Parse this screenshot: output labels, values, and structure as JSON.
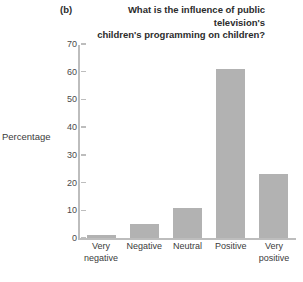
{
  "figure": {
    "panel_letter": "(b)",
    "title_line_1": "What is the influence of public television's",
    "title_line_2": "children's programming on children?",
    "bar_color": "#b2b2b2",
    "axis_color": "#bdbdbd",
    "text_color": "#3b3b3b"
  },
  "chart_data": {
    "type": "bar",
    "title": "What is the influence of public television's children's programming on children?",
    "xlabel": "",
    "ylabel": "Percentage",
    "categories": [
      "Very negative",
      "Negative",
      "Neutral",
      "Positive",
      "Very positive"
    ],
    "category_lines": [
      [
        "Very",
        "negative"
      ],
      [
        "Negative",
        ""
      ],
      [
        "Neutral",
        ""
      ],
      [
        "Positive",
        ""
      ],
      [
        "Very",
        "positive"
      ]
    ],
    "values": [
      1,
      5,
      11,
      61,
      23
    ],
    "ylim": [
      0,
      70
    ],
    "yticks": [
      0,
      10,
      20,
      30,
      40,
      50,
      60,
      70
    ],
    "ytick_labels": [
      "0",
      "10",
      "20",
      "30",
      "40",
      "50",
      "60",
      "70"
    ],
    "grid": false,
    "legend": null
  }
}
